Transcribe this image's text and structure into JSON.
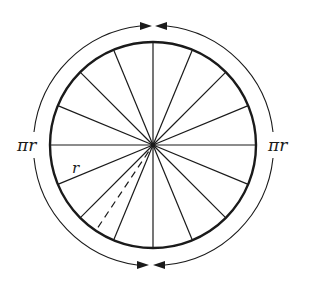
{
  "diagram": {
    "center": [
      153,
      145
    ],
    "radius": 103,
    "outer_radius": 120,
    "spoke_count": 16,
    "dashed_spoke_angle_deg": 213.75,
    "labels": {
      "left_arc": "πr",
      "right_arc": "πr",
      "radius": "r"
    },
    "colors": {
      "stroke": "#1a1a1a",
      "background": "#ffffff"
    }
  }
}
